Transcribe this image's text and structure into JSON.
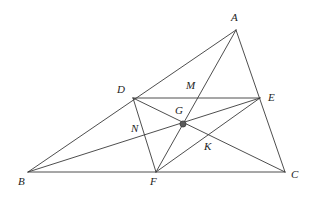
{
  "figure": {
    "kind": "geometry-diagram",
    "background_color": "#ffffff",
    "stroke_color": "#3a3a3a",
    "label_color": "#232323",
    "marked_point_fill": "#5a5a5a",
    "width": 309,
    "height": 198,
    "points": [
      {
        "name": "A",
        "label": "A",
        "x": 236,
        "y": 30,
        "label_x": 231,
        "label_y": 12,
        "marked": false
      },
      {
        "name": "B",
        "label": "B",
        "x": 28,
        "y": 172,
        "label_x": 18,
        "label_y": 176,
        "marked": false
      },
      {
        "name": "C",
        "label": "C",
        "x": 285,
        "y": 172,
        "label_x": 291,
        "label_y": 169,
        "marked": false
      },
      {
        "name": "D",
        "label": "D",
        "x": 133,
        "y": 98,
        "label_x": 117,
        "label_y": 84,
        "marked": false
      },
      {
        "name": "E",
        "label": "E",
        "x": 260,
        "y": 98,
        "label_x": 268,
        "label_y": 92,
        "marked": false
      },
      {
        "name": "F",
        "label": "F",
        "x": 156,
        "y": 172,
        "label_x": 150,
        "label_y": 176,
        "marked": false
      },
      {
        "name": "G",
        "label": "G",
        "x": 183,
        "y": 124,
        "label_x": 175,
        "label_y": 105,
        "marked": true
      },
      {
        "name": "M",
        "label": "M",
        "x": 196,
        "y": 98,
        "label_x": 186,
        "label_y": 80,
        "marked": false
      },
      {
        "name": "N",
        "label": "N",
        "x": 145,
        "y": 136,
        "label_x": 131,
        "label_y": 123,
        "marked": false
      },
      {
        "name": "K",
        "label": "K",
        "x": 210,
        "y": 140,
        "label_x": 204,
        "label_y": 141,
        "marked": false
      }
    ],
    "segments": [
      {
        "name": "side-AB",
        "from": "A",
        "to": "B"
      },
      {
        "name": "side-BC",
        "from": "B",
        "to": "C"
      },
      {
        "name": "side-CA",
        "from": "C",
        "to": "A"
      },
      {
        "name": "midsegment-DE",
        "from": "D",
        "to": "E"
      },
      {
        "name": "cevian-AF",
        "from": "A",
        "to": "F"
      },
      {
        "name": "cevian-BE",
        "from": "B",
        "to": "E"
      },
      {
        "name": "cevian-CD",
        "from": "C",
        "to": "D"
      },
      {
        "name": "segment-DF",
        "from": "D",
        "to": "F"
      },
      {
        "name": "segment-FE",
        "from": "F",
        "to": "E"
      }
    ]
  }
}
